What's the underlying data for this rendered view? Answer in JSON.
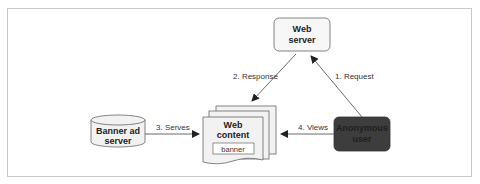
{
  "diagram": {
    "nodes": {
      "web_server": {
        "line1": "Web",
        "line2": "server"
      },
      "web_content": {
        "line1": "Web",
        "line2": "content",
        "banner": "banner"
      },
      "banner_ad_server": {
        "line1": "Banner ad",
        "line2": "server"
      },
      "anonymous_user": {
        "line1": "Anonymous",
        "line2": "user"
      }
    },
    "edges": [
      {
        "from": "anonymous_user",
        "to": "web_server",
        "label": "1. Request"
      },
      {
        "from": "web_server",
        "to": "web_content",
        "label": "2. Response"
      },
      {
        "from": "banner_ad_server",
        "to": "web_content",
        "label": "3. Serves"
      },
      {
        "from": "anonymous_user",
        "to": "web_content",
        "label": "4. Views"
      }
    ],
    "colors": {
      "anonymous_user_fill": "#3d3d3d",
      "box_fill": "#f2f2f2",
      "line": "#444444",
      "frame": "#c8c8c8"
    }
  }
}
